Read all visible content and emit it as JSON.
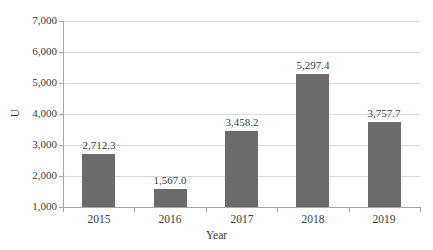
{
  "chart_data": {
    "type": "bar",
    "title": "",
    "subtitle": "",
    "xlabel": "Year",
    "ylabel": "U",
    "categories": [
      "2015",
      "2016",
      "2017",
      "2018",
      "2019"
    ],
    "values": [
      2712.3,
      1567.0,
      3458.2,
      5297.4,
      3757.7
    ],
    "data_labels": [
      "2,712.3",
      "1,567.0",
      "3,458.2",
      "5,297.4",
      "3,757.7"
    ],
    "series": [
      {
        "name": "",
        "values": [
          2712.3,
          1567.0,
          3458.2,
          5297.4,
          3757.7
        ]
      }
    ],
    "ylim": [
      1000,
      7000
    ],
    "ytick_values": [
      1000,
      2000,
      3000,
      4000,
      5000,
      6000,
      7000
    ],
    "ytick_labels": [
      "1,000",
      "2,000",
      "3,000",
      "4,000",
      "5,000",
      "6,000",
      "7,000"
    ],
    "grid": true,
    "grid_axis": "y",
    "legend": false,
    "legend_position": "none",
    "bar_color": "#6b6b6b",
    "grid_color": "#dadada",
    "axis_color": "#a6a6a6",
    "text_color": "#3b3b3b",
    "background_color": "#ffffff"
  }
}
